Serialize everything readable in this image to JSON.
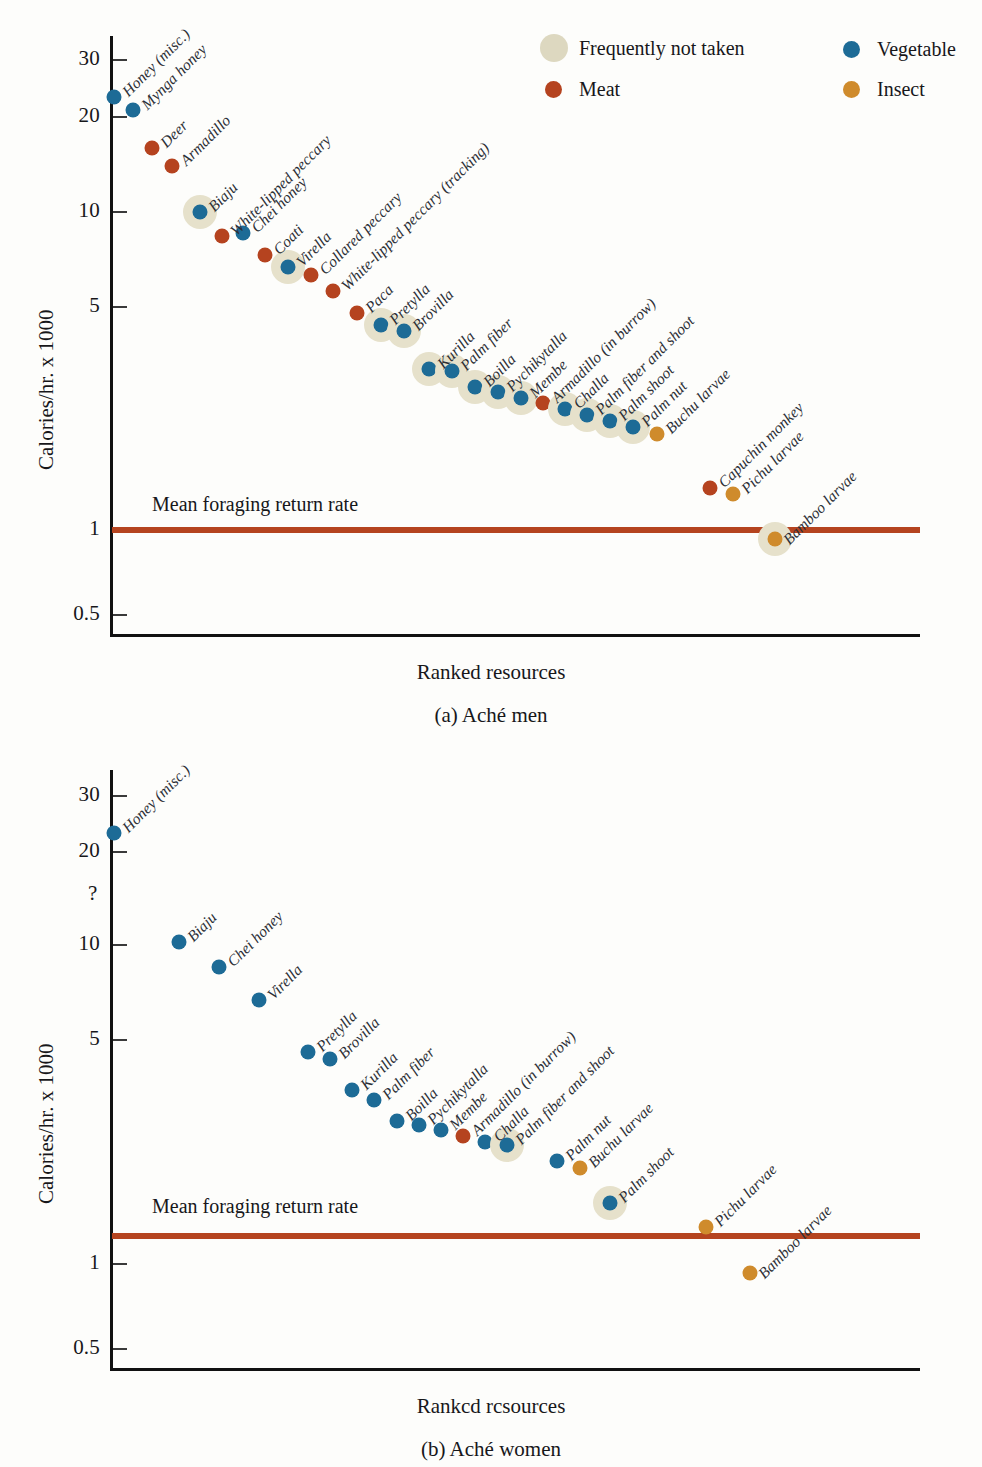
{
  "figure": {
    "y_axis_title": "Calories/hr. x 1000",
    "x_axis_title_a": "Ranked resources",
    "x_axis_title_b": "Rankcd rcsources",
    "caption_a": "(a) Aché men",
    "caption_b": "(b) Aché women",
    "mean_line_label": "Mean foraging return rate",
    "question_mark": "?"
  },
  "colors": {
    "vegetable": "#1d6b96",
    "meat": "#b5431f",
    "insect": "#cf8b2c",
    "frequently_not_taken": "#e6e1cb",
    "mean_line": "#b5441f",
    "axis": "#111111"
  },
  "legend": {
    "items": [
      {
        "label": "Frequently not taken",
        "key": "notaken"
      },
      {
        "label": "Vegetable",
        "key": "veg"
      },
      {
        "label": "Meat",
        "key": "meat"
      },
      {
        "label": "Insect",
        "key": "insect"
      }
    ]
  },
  "chart_data": [
    {
      "type": "scatter",
      "title": "(a) Aché men",
      "xlabel": "Ranked resources",
      "ylabel": "Calories/hr. x 1000",
      "yscale": "log",
      "ylim": [
        0.5,
        35
      ],
      "yticks": [
        0.5,
        1,
        5,
        10,
        20,
        30
      ],
      "ytick_labels": [
        "0.5",
        "1",
        "5",
        "10",
        "20",
        "30"
      ],
      "grid": false,
      "legend_position": "top-right",
      "annotations": [
        {
          "text": "Mean foraging return rate",
          "y": 1.25,
          "type": "hline"
        }
      ],
      "points": [
        {
          "label": "Honey (misc.)",
          "rank": 1,
          "value": 23.0,
          "category": "Vegetable",
          "frequently_not_taken": false
        },
        {
          "label": "Mynga honey",
          "rank": 2,
          "value": 21.0,
          "category": "Vegetable",
          "frequently_not_taken": false
        },
        {
          "label": "Deer",
          "rank": 3,
          "value": 16.0,
          "category": "Meat",
          "frequently_not_taken": false
        },
        {
          "label": "Armadillo",
          "rank": 4,
          "value": 14.0,
          "category": "Meat",
          "frequently_not_taken": false
        },
        {
          "label": "Biaju",
          "rank": 5,
          "value": 10.0,
          "category": "Vegetable",
          "frequently_not_taken": true
        },
        {
          "label": "White-lipped peccary",
          "rank": 6,
          "value": 8.4,
          "category": "Meat",
          "frequently_not_taken": false
        },
        {
          "label": "Chei honey",
          "rank": 7,
          "value": 8.6,
          "category": "Vegetable",
          "frequently_not_taken": false
        },
        {
          "label": "Coati",
          "rank": 8,
          "value": 7.3,
          "category": "Meat",
          "frequently_not_taken": false
        },
        {
          "label": "Virella",
          "rank": 9,
          "value": 6.7,
          "category": "Vegetable",
          "frequently_not_taken": true
        },
        {
          "label": "Collared peccary",
          "rank": 10,
          "value": 6.3,
          "category": "Meat",
          "frequently_not_taken": false
        },
        {
          "label": "White-lipped peccary (tracking)",
          "rank": 11,
          "value": 5.6,
          "category": "Meat",
          "frequently_not_taken": false
        },
        {
          "label": "Paca",
          "rank": 12,
          "value": 4.8,
          "category": "Meat",
          "frequently_not_taken": false
        },
        {
          "label": "Pretylla",
          "rank": 13,
          "value": 4.4,
          "category": "Vegetable",
          "frequently_not_taken": true
        },
        {
          "label": "Brovilla",
          "rank": 14,
          "value": 4.2,
          "category": "Vegetable",
          "frequently_not_taken": true
        },
        {
          "label": "Kurilla",
          "rank": 15,
          "value": 3.2,
          "category": "Vegetable",
          "frequently_not_taken": true
        },
        {
          "label": "Palm fiber",
          "rank": 16,
          "value": 3.15,
          "category": "Vegetable",
          "frequently_not_taken": true
        },
        {
          "label": "Boilla",
          "rank": 17,
          "value": 2.8,
          "category": "Vegetable",
          "frequently_not_taken": true
        },
        {
          "label": "Pychikytalla",
          "rank": 18,
          "value": 2.7,
          "category": "Vegetable",
          "frequently_not_taken": true
        },
        {
          "label": "Membe",
          "rank": 19,
          "value": 2.6,
          "category": "Vegetable",
          "frequently_not_taken": true
        },
        {
          "label": "Armadillo (in burrow)",
          "rank": 20,
          "value": 2.5,
          "category": "Meat",
          "frequently_not_taken": false
        },
        {
          "label": "Challa",
          "rank": 21,
          "value": 2.4,
          "category": "Vegetable",
          "frequently_not_taken": true
        },
        {
          "label": "Palm fiber and shoot",
          "rank": 22,
          "value": 2.3,
          "category": "Vegetable",
          "frequently_not_taken": true
        },
        {
          "label": "Palm shoot",
          "rank": 23,
          "value": 2.2,
          "category": "Vegetable",
          "frequently_not_taken": true
        },
        {
          "label": "Palm nut",
          "rank": 24,
          "value": 2.1,
          "category": "Vegetable",
          "frequently_not_taken": true
        },
        {
          "label": "Buchu larvae",
          "rank": 25,
          "value": 2.0,
          "category": "Insect",
          "frequently_not_taken": false
        },
        {
          "label": "Capuchin monkey",
          "rank": 26,
          "value": 1.35,
          "category": "Meat",
          "frequently_not_taken": false
        },
        {
          "label": "Pichu larvae",
          "rank": 27,
          "value": 1.3,
          "category": "Insect",
          "frequently_not_taken": false
        },
        {
          "label": "Bamboo larvae",
          "rank": 28,
          "value": 0.93,
          "category": "Insect",
          "frequently_not_taken": true
        }
      ]
    },
    {
      "type": "scatter",
      "title": "(b) Aché women",
      "xlabel": "Rankcd rcsources",
      "ylabel": "Calories/hr. x 1000",
      "yscale": "log",
      "ylim": [
        0.5,
        35
      ],
      "yticks": [
        0.5,
        1,
        5,
        10,
        20,
        30
      ],
      "ytick_labels": [
        "0.5",
        "1",
        "5",
        "10",
        "20",
        "30"
      ],
      "grid": false,
      "annotations": [
        {
          "text": "Mean foraging return rate",
          "y": 1.25,
          "type": "hline"
        },
        {
          "text": "?",
          "type": "axis-break"
        }
      ],
      "points": [
        {
          "label": "Honey (misc.)",
          "rank": 1,
          "value": 23.0,
          "category": "Vegetable",
          "frequently_not_taken": false
        },
        {
          "label": "Biaju",
          "rank": 2,
          "value": 10.2,
          "category": "Vegetable",
          "frequently_not_taken": false
        },
        {
          "label": "Chei honey",
          "rank": 3,
          "value": 8.5,
          "category": "Vegetable",
          "frequently_not_taken": false
        },
        {
          "label": "Virella",
          "rank": 4,
          "value": 6.7,
          "category": "Vegetable",
          "frequently_not_taken": false
        },
        {
          "label": "Pretylla",
          "rank": 5,
          "value": 4.6,
          "category": "Vegetable",
          "frequently_not_taken": false
        },
        {
          "label": "Brovilla",
          "rank": 6,
          "value": 4.35,
          "category": "Vegetable",
          "frequently_not_taken": false
        },
        {
          "label": "Kurilla",
          "rank": 7,
          "value": 3.5,
          "category": "Vegetable",
          "frequently_not_taken": false
        },
        {
          "label": "Palm fiber",
          "rank": 8,
          "value": 3.25,
          "category": "Vegetable",
          "frequently_not_taken": false
        },
        {
          "label": "Boilla",
          "rank": 9,
          "value": 2.8,
          "category": "Vegetable",
          "frequently_not_taken": false
        },
        {
          "label": "Pychikytalla",
          "rank": 10,
          "value": 2.72,
          "category": "Vegetable",
          "frequently_not_taken": false
        },
        {
          "label": "Membe",
          "rank": 11,
          "value": 2.62,
          "category": "Vegetable",
          "frequently_not_taken": false
        },
        {
          "label": "Armadillo (in burrow)",
          "rank": 12,
          "value": 2.5,
          "category": "Meat",
          "frequently_not_taken": false
        },
        {
          "label": "Challa",
          "rank": 13,
          "value": 2.4,
          "category": "Vegetable",
          "frequently_not_taken": false
        },
        {
          "label": "Palm fiber and shoot",
          "rank": 14,
          "value": 2.35,
          "category": "Vegetable",
          "frequently_not_taken": true
        },
        {
          "label": "Palm nut",
          "rank": 15,
          "value": 2.1,
          "category": "Vegetable",
          "frequently_not_taken": false
        },
        {
          "label": "Buchu larvae",
          "rank": 16,
          "value": 2.0,
          "category": "Insect",
          "frequently_not_taken": false
        },
        {
          "label": "Palm shoot",
          "rank": 17,
          "value": 1.55,
          "category": "Vegetable",
          "frequently_not_taken": true
        },
        {
          "label": "Pichu larvae",
          "rank": 18,
          "value": 1.3,
          "category": "Insect",
          "frequently_not_taken": false
        },
        {
          "label": "Bamboo larvae",
          "rank": 19,
          "value": 0.93,
          "category": "Insect",
          "frequently_not_taken": false
        }
      ]
    }
  ]
}
